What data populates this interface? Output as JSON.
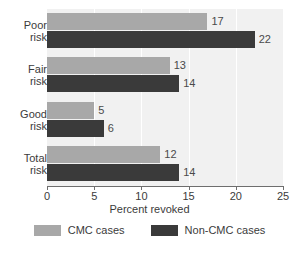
{
  "chart_data": {
    "type": "bar",
    "orientation": "horizontal",
    "title": "",
    "xlabel": "Percent revoked",
    "ylabel": "",
    "xlim": [
      0,
      25
    ],
    "xticks": [
      0,
      5,
      10,
      15,
      20,
      25
    ],
    "xtick_labels": [
      "0",
      "5",
      "10",
      "15",
      "20",
      "25"
    ],
    "grid": true,
    "grid_axis": "x",
    "grid_color": "#ffffff",
    "plot_background": "#f1f1f1",
    "legend_position": "bottom",
    "categories": [
      "Poor risk",
      "Fair risk",
      "Good risk",
      "Total risk"
    ],
    "category_lines": [
      [
        "Poor",
        "risk"
      ],
      [
        "Fair",
        "risk"
      ],
      [
        "Good",
        "risk"
      ],
      [
        "Total",
        "risk"
      ]
    ],
    "series": [
      {
        "name": "CMC cases",
        "color": "#a8a8a8",
        "values": [
          17,
          13,
          5,
          12
        ],
        "value_labels": [
          "17",
          "13",
          "5",
          "12"
        ]
      },
      {
        "name": "Non-CMC cases",
        "color": "#3a3a3a",
        "values": [
          22,
          14,
          6,
          14
        ],
        "value_labels": [
          "22",
          "14",
          "6",
          "14"
        ]
      }
    ]
  },
  "legend": {
    "items": [
      {
        "label": "CMC cases",
        "color": "#a8a8a8"
      },
      {
        "label": "Non-CMC cases",
        "color": "#3a3a3a"
      }
    ]
  }
}
